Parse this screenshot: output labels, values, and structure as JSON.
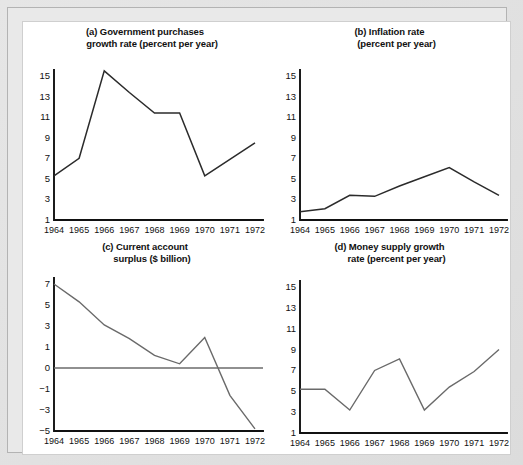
{
  "figure": {
    "background_color": "#dcdcdc",
    "sheet_color": "#ffffff",
    "line_color": "#2b2b2b"
  },
  "panels": [
    {
      "key": "a",
      "title_line1": "(a) Government purchases",
      "title_line2": "growth rate (percent per year)"
    },
    {
      "key": "b",
      "title_line1": "(b) Inflation rate",
      "title_line2": "(percent per year)"
    },
    {
      "key": "c",
      "title_line1": "(c) Current account",
      "title_line2": "surplus ($ billion)"
    },
    {
      "key": "d",
      "title_line1": "(d) Money supply growth",
      "title_line2": "rate (percent per year)"
    }
  ],
  "chart_data": [
    {
      "type": "line",
      "panel": "a",
      "title": "(a) Government purchases growth rate (percent per year)",
      "xlabel": "",
      "ylabel": "percent per year",
      "x": [
        1964,
        1965,
        1966,
        1967,
        1968,
        1969,
        1970,
        1971,
        1972
      ],
      "categories": [
        "1964",
        "1965",
        "1966",
        "1967",
        "1968",
        "1969",
        "1970",
        "1971",
        "1972"
      ],
      "values": [
        5.3,
        7.0,
        15.5,
        13.4,
        11.4,
        11.4,
        5.3,
        6.9,
        8.5
      ],
      "yticks": [
        1,
        3,
        5,
        7,
        9,
        11,
        13,
        15
      ],
      "ylim": [
        1,
        15
      ],
      "grid": false,
      "legend": "none"
    },
    {
      "type": "line",
      "panel": "b",
      "title": "(b) Inflation rate (percent per year)",
      "xlabel": "",
      "ylabel": "percent per year",
      "x": [
        1964,
        1965,
        1966,
        1967,
        1968,
        1969,
        1970,
        1971,
        1972
      ],
      "categories": [
        "1964",
        "1965",
        "1966",
        "1967",
        "1968",
        "1969",
        "1970",
        "1971",
        "1972"
      ],
      "values": [
        1.8,
        2.1,
        3.4,
        3.3,
        4.3,
        5.2,
        6.1,
        4.7,
        3.4
      ],
      "yticks": [
        1,
        3,
        5,
        7,
        9,
        11,
        13,
        15
      ],
      "ylim": [
        1,
        15
      ],
      "grid": false,
      "legend": "none"
    },
    {
      "type": "line",
      "panel": "c",
      "title": "(c) Current account surplus ($ billion)",
      "xlabel": "",
      "ylabel": "$ billion",
      "x": [
        1964,
        1965,
        1966,
        1967,
        1968,
        1969,
        1970,
        1971,
        1972
      ],
      "categories": [
        "1964",
        "1965",
        "1966",
        "1967",
        "1968",
        "1969",
        "1970",
        "1971",
        "1972"
      ],
      "values": [
        7.0,
        5.3,
        3.1,
        1.8,
        0.6,
        0.2,
        1.9,
        -1.6,
        -4.8
      ],
      "yticks": [
        7,
        5,
        3,
        1,
        0,
        -1,
        -3,
        -5
      ],
      "ytick_labels": [
        "7",
        "5",
        "3",
        "1",
        "0",
        "−1",
        "−3",
        "−5"
      ],
      "ylim": [
        -5,
        7
      ],
      "zero_line": 0,
      "grid": false,
      "legend": "none"
    },
    {
      "type": "line",
      "panel": "d",
      "title": "(d) Money supply growth rate (percent per year)",
      "xlabel": "",
      "ylabel": "percent per year",
      "x": [
        1964,
        1965,
        1966,
        1967,
        1968,
        1969,
        1970,
        1971,
        1972
      ],
      "categories": [
        "1964",
        "1965",
        "1966",
        "1967",
        "1968",
        "1969",
        "1970",
        "1971",
        "1972"
      ],
      "values": [
        5.2,
        5.2,
        3.2,
        7.0,
        8.1,
        3.2,
        5.4,
        6.9,
        9.0
      ],
      "yticks": [
        1,
        3,
        5,
        7,
        9,
        11,
        13,
        15
      ],
      "ylim": [
        1,
        15
      ],
      "grid": false,
      "legend": "none"
    }
  ]
}
